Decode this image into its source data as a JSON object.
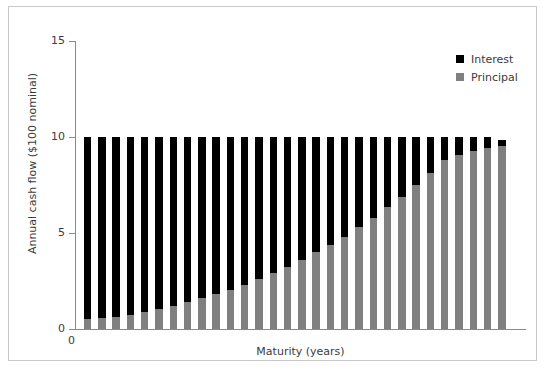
{
  "chart_data": {
    "type": "bar",
    "title": "",
    "subtitle": "",
    "xlabel": "Maturity (years)",
    "ylabel": "Annual cash flow ($100 nominal)",
    "stacked": true,
    "grid": false,
    "legend_position": "top-right",
    "ylim": [
      0,
      15
    ],
    "yticks": [
      0,
      5,
      10,
      15
    ],
    "ytick_labels": [
      "0",
      "5",
      "10",
      "15"
    ],
    "xlim": [
      0,
      31
    ],
    "xticks": [
      0
    ],
    "xtick_labels": [
      "0"
    ],
    "categories": [
      1,
      2,
      3,
      4,
      5,
      6,
      7,
      8,
      9,
      10,
      11,
      12,
      13,
      14,
      15,
      16,
      17,
      18,
      19,
      20,
      21,
      22,
      23,
      24,
      25,
      26,
      27,
      28,
      29,
      30
    ],
    "series": [
      {
        "name": "Interest",
        "color": "#000000",
        "values": [
          9.5,
          9.45,
          9.35,
          9.25,
          9.1,
          8.95,
          8.8,
          8.6,
          8.4,
          8.2,
          7.95,
          7.7,
          7.4,
          7.1,
          6.75,
          6.4,
          6.0,
          5.6,
          5.2,
          4.7,
          4.2,
          3.65,
          3.1,
          2.5,
          1.85,
          1.2,
          0.95,
          0.75,
          0.55,
          0.3
        ]
      },
      {
        "name": "Principal",
        "color": "#808080",
        "values": [
          0.5,
          0.55,
          0.65,
          0.75,
          0.9,
          1.05,
          1.2,
          1.4,
          1.6,
          1.8,
          2.05,
          2.3,
          2.6,
          2.9,
          3.25,
          3.6,
          4.0,
          4.4,
          4.8,
          5.3,
          5.8,
          6.35,
          6.9,
          7.5,
          8.15,
          8.8,
          9.05,
          9.25,
          9.45,
          9.55
        ]
      }
    ],
    "totals": [
      10,
      10,
      10,
      10,
      10,
      10,
      10,
      10,
      10,
      10,
      10,
      10,
      10,
      10,
      10,
      10,
      10,
      10,
      10,
      10,
      10,
      10,
      10,
      10,
      10,
      10,
      10,
      10,
      10,
      9.85
    ]
  },
  "legend": {
    "items": [
      {
        "label": "Interest",
        "color": "#000000"
      },
      {
        "label": "Principal",
        "color": "#808080"
      }
    ]
  },
  "axes": {
    "y_title": "Annual cash flow ($100 nominal)",
    "x_title": "Maturity (years)",
    "y_tick_labels": [
      "15",
      "10",
      "5",
      "0"
    ],
    "x_origin_label": "0"
  },
  "colors": {
    "interest": "#000000",
    "principal": "#808080",
    "axis": "#8a8a8a",
    "text": "#3b3b3b",
    "frame": "#c9c9c9",
    "background": "#ffffff"
  }
}
